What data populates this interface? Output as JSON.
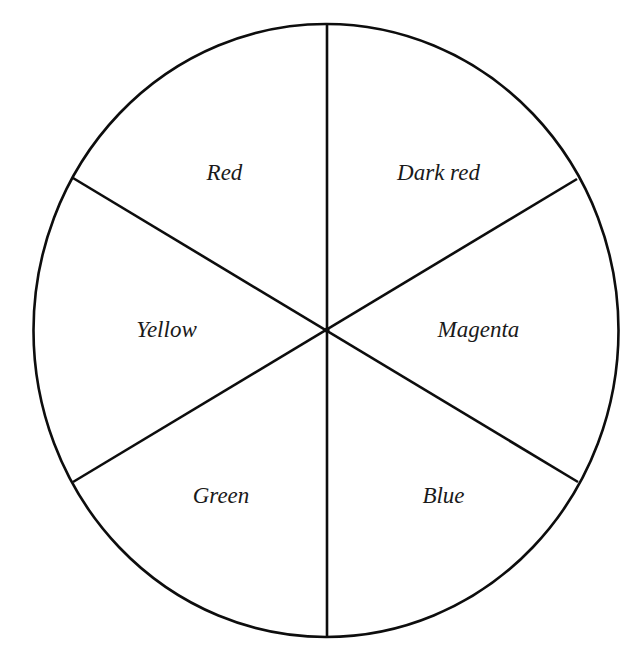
{
  "diagram": {
    "type": "color-wheel",
    "segment_count": 6,
    "stroke_color": "#0d0d0d",
    "background": "#ffffff",
    "segments": [
      {
        "label": "Red",
        "position": "upper-left"
      },
      {
        "label": "Dark red",
        "position": "upper-right"
      },
      {
        "label": "Magenta",
        "position": "right"
      },
      {
        "label": "Blue",
        "position": "lower-right"
      },
      {
        "label": "Green",
        "position": "lower-left"
      },
      {
        "label": "Yellow",
        "position": "left"
      }
    ]
  }
}
